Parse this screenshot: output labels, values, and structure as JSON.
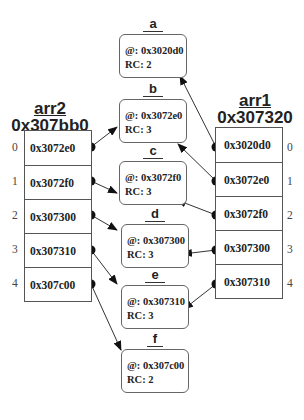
{
  "arrays": {
    "arr2": {
      "name": "arr2",
      "address": "0x307bb0",
      "cells": [
        "0x3072e0",
        "0x3072f0",
        "0x307300",
        "0x307310",
        "0x307c00"
      ],
      "indices": [
        "0",
        "1",
        "2",
        "3",
        "4"
      ]
    },
    "arr1": {
      "name": "arr1",
      "address": "0x307320",
      "cells": [
        "0x3020d0",
        "0x3072e0",
        "0x3072f0",
        "0x307300",
        "0x307310"
      ],
      "indices": [
        "0",
        "1",
        "2",
        "3",
        "4"
      ]
    }
  },
  "objects": [
    {
      "label": "a",
      "addr": "@: 0x3020d0",
      "rc": "RC: 2"
    },
    {
      "label": "b",
      "addr": "@: 0x3072e0",
      "rc": "RC: 3"
    },
    {
      "label": "c",
      "addr": "@: 0x3072f0",
      "rc": "RC: 3"
    },
    {
      "label": "d",
      "addr": "@: 0x307300",
      "rc": "RC: 3"
    },
    {
      "label": "e",
      "addr": "@: 0x307310",
      "rc": "RC: 3"
    },
    {
      "label": "f",
      "addr": "@: 0x307c00",
      "rc": "RC: 2"
    }
  ]
}
